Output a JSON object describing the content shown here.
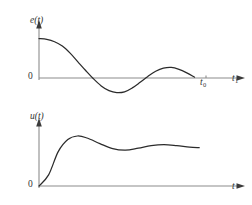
{
  "figure": {
    "background_color": "#ffffff",
    "curve_color": "#2b2b2b",
    "axis_color": "#8c8c8c",
    "width": 252,
    "height": 205
  },
  "chart_data": [
    {
      "type": "line",
      "title": "",
      "ylabel": "e(t)",
      "xlabel": "t",
      "grid": false,
      "legend": null,
      "annotations": [
        "t_0",
        "t_1"
      ],
      "origin_label": "0",
      "description": "Damped oscillating error signal decaying toward zero",
      "axis_origin_px": [
        39,
        78
      ],
      "axis_x_end_px": 244,
      "axis_y_top_px": 22,
      "x": [
        0,
        0.08,
        0.17,
        0.25,
        0.33,
        0.42,
        0.5,
        0.58,
        0.67,
        0.75,
        0.83,
        0.92,
        1.0
      ],
      "y": [
        1.0,
        0.94,
        0.72,
        0.36,
        0.0,
        -0.28,
        -0.37,
        -0.24,
        0.0,
        0.2,
        0.26,
        0.17,
        0.0
      ],
      "x_detail": [
        0,
        0.05,
        0.1,
        0.15,
        0.2,
        0.25,
        0.3,
        0.35,
        0.4,
        0.45,
        0.5,
        0.55,
        0.6,
        0.65,
        0.7,
        0.75,
        0.8,
        0.85,
        0.9,
        0.95,
        1.0
      ],
      "y_detail": [
        1.0,
        0.98,
        0.92,
        0.81,
        0.63,
        0.41,
        0.19,
        -0.02,
        -0.2,
        -0.32,
        -0.37,
        -0.35,
        -0.25,
        -0.11,
        0.04,
        0.17,
        0.25,
        0.27,
        0.22,
        0.13,
        0.02
      ],
      "ylim": [
        -0.55,
        1.25
      ],
      "xlim": [
        0,
        1.08
      ]
    },
    {
      "type": "line",
      "title": "",
      "ylabel": "u(t)",
      "xlabel": "t",
      "grid": false,
      "legend": null,
      "annotations": [],
      "origin_label": "0",
      "description": "Control signal step response: fast rise, overshoot, settling to steady state",
      "axis_origin_px": [
        39,
        186
      ],
      "axis_x_end_px": 244,
      "axis_y_top_px": 120,
      "x": [
        0,
        0.06,
        0.12,
        0.18,
        0.24,
        0.3,
        0.38,
        0.46,
        0.54,
        0.62,
        0.7,
        0.78,
        0.86,
        0.94,
        1.0
      ],
      "y": [
        0.0,
        0.22,
        0.68,
        0.92,
        0.99,
        0.95,
        0.84,
        0.74,
        0.71,
        0.75,
        0.8,
        0.82,
        0.8,
        0.77,
        0.76
      ],
      "ylim": [
        0,
        1.15
      ],
      "xlim": [
        0,
        1.08
      ]
    }
  ],
  "labels": {
    "top_y_axis": "e(t)",
    "top_origin": "0",
    "top_tick_t0_base": "t",
    "top_tick_t0_sub": "0",
    "top_tick_t1_base": "t",
    "top_tick_t1_sub": "1",
    "bottom_y_axis": "u(t)",
    "bottom_origin": "0",
    "bottom_x_axis": "t"
  }
}
